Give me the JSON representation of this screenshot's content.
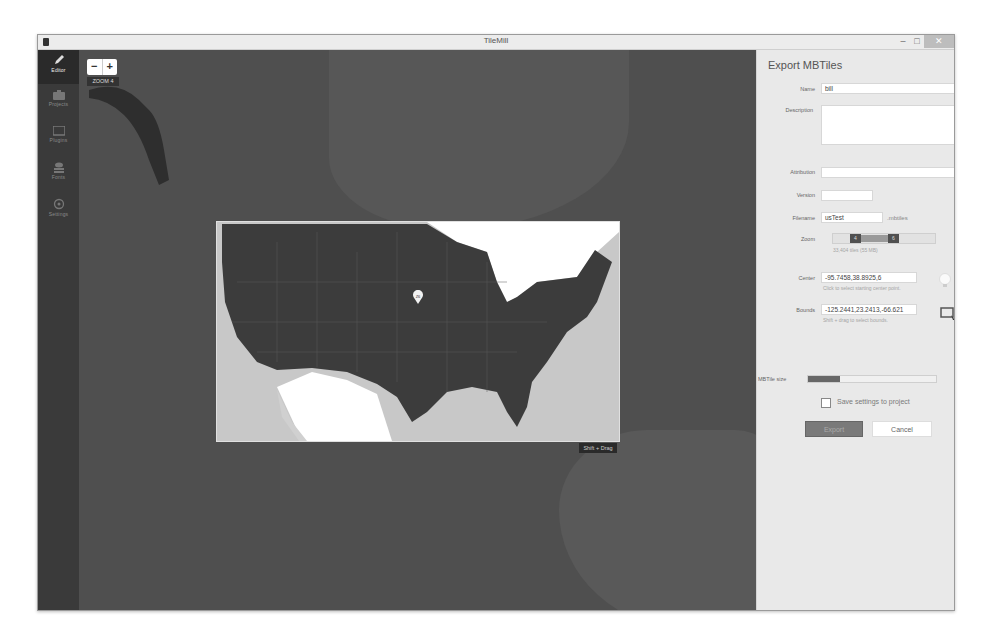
{
  "window": {
    "title": "TileMill",
    "controls": {
      "minimize": "–",
      "maximize": "□",
      "close": "✕"
    }
  },
  "sidebar": {
    "items": [
      {
        "label": "Editor",
        "icon": "pencil-icon",
        "active": true
      },
      {
        "label": "Projects",
        "icon": "briefcase-icon",
        "active": false
      },
      {
        "label": "Plugins",
        "icon": "card-icon",
        "active": false
      },
      {
        "label": "Fonts",
        "icon": "stack-icon",
        "active": false
      },
      {
        "label": "Settings",
        "icon": "gear-icon",
        "active": false
      }
    ]
  },
  "map": {
    "zoom_out": "−",
    "zoom_in": "+",
    "zoom_label": "ZOOM 4",
    "center_marker": "Z6",
    "shift_tip": "Shift + Drag"
  },
  "panel": {
    "title": "Export MBTiles",
    "fields": {
      "name": {
        "label": "Name",
        "value": "bill"
      },
      "description": {
        "label": "Description",
        "value": ""
      },
      "attribution": {
        "label": "Attribution",
        "value": ""
      },
      "version": {
        "label": "Version",
        "value": ""
      },
      "filename": {
        "label": "Filename",
        "value": "usTest",
        "suffix": ".mbtiles"
      },
      "zoom": {
        "label": "Zoom",
        "min": "4",
        "max": "6",
        "hint": "33,404 tiles (55 MB)"
      },
      "center": {
        "label": "Center",
        "value": "-95.7458,38.8925,6",
        "hint": "Click to select starting center point."
      },
      "bounds": {
        "label": "Bounds",
        "value": "-125.2441,23.2413,-66.621",
        "hint": "Shift + drag to select bounds."
      },
      "mbtile_size": {
        "label": "MBTile size"
      }
    },
    "checkbox_label": "Save settings to project",
    "export_label": "Export",
    "cancel_label": "Cancel"
  }
}
